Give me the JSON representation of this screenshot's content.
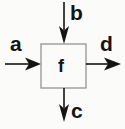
{
  "diagram": {
    "type": "block-diagram",
    "background_color": "#fbfbfa",
    "stroke_color": "#141414",
    "box_border_color": "#8c8c8c",
    "box_fill_color": "#fbfbfa",
    "block": {
      "label": "f",
      "name": "function-block",
      "x": 41,
      "y": 44,
      "width": 45,
      "height": 44
    },
    "ports": [
      {
        "id": "a",
        "label": "a",
        "direction": "input",
        "side": "left",
        "arrow": "right",
        "line_from": [
          5,
          64
        ],
        "line_to": [
          41,
          64
        ],
        "label_x": 10,
        "label_y": 33
      },
      {
        "id": "b",
        "label": "b",
        "direction": "input",
        "side": "top",
        "arrow": "down",
        "line_from": [
          64,
          2
        ],
        "line_to": [
          64,
          44
        ],
        "label_x": 70,
        "label_y": 2
      },
      {
        "id": "d",
        "label": "d",
        "direction": "output",
        "side": "right",
        "arrow": "right",
        "line_from": [
          86,
          64
        ],
        "line_to": [
          120,
          64
        ],
        "label_x": 100,
        "label_y": 33
      },
      {
        "id": "c",
        "label": "c",
        "direction": "output",
        "side": "bottom",
        "arrow": "down",
        "line_from": [
          64,
          88
        ],
        "line_to": [
          64,
          122
        ],
        "label_x": 71,
        "label_y": 100
      }
    ]
  }
}
